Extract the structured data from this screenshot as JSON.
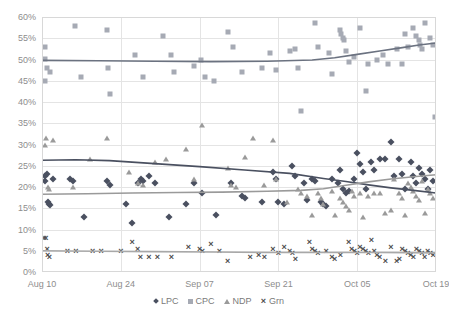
{
  "chart_data": {
    "type": "scatter",
    "title": "",
    "xlabel": "",
    "ylabel": "",
    "ylim": [
      0,
      60
    ],
    "ytick_labels": [
      "0%",
      "5%",
      "10%",
      "15%",
      "20%",
      "25%",
      "30%",
      "35%",
      "40%",
      "45%",
      "50%",
      "55%",
      "60%"
    ],
    "ytick_values": [
      0,
      5,
      10,
      15,
      20,
      25,
      30,
      35,
      40,
      45,
      50,
      55,
      60
    ],
    "xtick_labels": [
      "Aug 10",
      "Aug 24",
      "Sep 07",
      "Sep 21",
      "Oct 05",
      "Oct 19"
    ],
    "xtick_values": [
      0,
      14,
      28,
      42,
      56,
      70
    ],
    "xlim": [
      0,
      70
    ],
    "grid": true,
    "legend_position": "bottom",
    "legend": [
      "LPC",
      "CPC",
      "NDP",
      "Grn"
    ],
    "series": [
      {
        "name": "CPC",
        "marker": "square",
        "color": "#a6aab4",
        "trend_color": "#6b7280",
        "points": [
          [
            0.6,
            53.0
          ],
          [
            0.6,
            50.2
          ],
          [
            0.6,
            45.0
          ],
          [
            0.8,
            48.0
          ],
          [
            1.4,
            47.0
          ],
          [
            5.8,
            58.0
          ],
          [
            7.0,
            46.0
          ],
          [
            11.6,
            57.0
          ],
          [
            11.8,
            48.0
          ],
          [
            12.0,
            42.0
          ],
          [
            16.5,
            51.0
          ],
          [
            18.0,
            46.0
          ],
          [
            21.5,
            55.5
          ],
          [
            23.0,
            51.0
          ],
          [
            23.5,
            47.0
          ],
          [
            27.0,
            48.5
          ],
          [
            28.2,
            50.0
          ],
          [
            29.0,
            46.0
          ],
          [
            30.5,
            45.0
          ],
          [
            33.0,
            56.5
          ],
          [
            34.0,
            53.0
          ],
          [
            35.5,
            47.0
          ],
          [
            39.0,
            48.0
          ],
          [
            40.5,
            51.5
          ],
          [
            41.5,
            47.5
          ],
          [
            44.0,
            52.0
          ],
          [
            45.0,
            52.5
          ],
          [
            45.4,
            48.0
          ],
          [
            46.0,
            38.0
          ],
          [
            48.5,
            58.5
          ],
          [
            49.0,
            53.0
          ],
          [
            51.0,
            51.5
          ],
          [
            51.5,
            46.5
          ],
          [
            53.0,
            57.0
          ],
          [
            53.2,
            56.0
          ],
          [
            53.4,
            55.0
          ],
          [
            53.6,
            54.5
          ],
          [
            54.0,
            52.0
          ],
          [
            54.5,
            49.5
          ],
          [
            55.5,
            50.5
          ],
          [
            56.5,
            57.5
          ],
          [
            57.5,
            42.5
          ],
          [
            58.0,
            49.0
          ],
          [
            59.5,
            50.0
          ],
          [
            60.5,
            51.0
          ],
          [
            61.5,
            49.0
          ],
          [
            63.0,
            52.5
          ],
          [
            64.0,
            49.0
          ],
          [
            64.5,
            56.0
          ],
          [
            65.0,
            53.0
          ],
          [
            66.0,
            57.5
          ],
          [
            66.5,
            55.5
          ],
          [
            67.0,
            54.5
          ],
          [
            67.2,
            53.5
          ],
          [
            67.5,
            52.5
          ],
          [
            68.0,
            58.5
          ],
          [
            69.0,
            55.0
          ],
          [
            69.5,
            53.5
          ],
          [
            69.8,
            36.5
          ]
        ],
        "trend": [
          [
            0,
            49.8
          ],
          [
            10,
            49.7
          ],
          [
            20,
            49.6
          ],
          [
            30,
            49.5
          ],
          [
            40,
            49.6
          ],
          [
            48,
            49.9
          ],
          [
            52,
            50.4
          ],
          [
            56,
            51.2
          ],
          [
            60,
            52.0
          ],
          [
            64,
            52.8
          ],
          [
            67,
            53.4
          ],
          [
            70,
            53.9
          ]
        ]
      },
      {
        "name": "LPC",
        "marker": "diamond",
        "color": "#4a5060",
        "trend_color": "#4a5060",
        "points": [
          [
            0.5,
            22.5
          ],
          [
            0.6,
            21.5
          ],
          [
            0.8,
            23.0
          ],
          [
            1.0,
            16.5
          ],
          [
            1.2,
            16.0
          ],
          [
            1.5,
            15.8
          ],
          [
            2.0,
            22.0
          ],
          [
            5.0,
            22.0
          ],
          [
            5.5,
            21.5
          ],
          [
            7.5,
            13.0
          ],
          [
            11.5,
            21.5
          ],
          [
            12.0,
            20.5
          ],
          [
            15.0,
            16.0
          ],
          [
            16.0,
            11.5
          ],
          [
            17.0,
            21.0
          ],
          [
            17.5,
            22.0
          ],
          [
            18.0,
            21.5
          ],
          [
            19.0,
            22.5
          ],
          [
            20.0,
            21.0
          ],
          [
            22.5,
            13.0
          ],
          [
            25.5,
            16.0
          ],
          [
            27.0,
            21.0
          ],
          [
            28.5,
            18.5
          ],
          [
            31.0,
            13.5
          ],
          [
            33.5,
            21.0
          ],
          [
            35.5,
            18.0
          ],
          [
            36.0,
            17.5
          ],
          [
            39.0,
            16.5
          ],
          [
            41.0,
            23.5
          ],
          [
            41.5,
            22.0
          ],
          [
            42.0,
            16.5
          ],
          [
            43.0,
            16.0
          ],
          [
            44.5,
            25.0
          ],
          [
            45.0,
            22.5
          ],
          [
            46.5,
            21.0
          ],
          [
            47.0,
            17.0
          ],
          [
            48.0,
            22.0
          ],
          [
            48.5,
            21.5
          ],
          [
            49.5,
            16.5
          ],
          [
            50.0,
            16.0
          ],
          [
            50.5,
            15.5
          ],
          [
            51.5,
            22.0
          ],
          [
            52.5,
            21.0
          ],
          [
            53.0,
            24.0
          ],
          [
            53.5,
            19.5
          ],
          [
            54.0,
            18.5
          ],
          [
            54.5,
            19.0
          ],
          [
            55.5,
            22.0
          ],
          [
            56.0,
            28.0
          ],
          [
            56.5,
            25.5
          ],
          [
            57.0,
            23.5
          ],
          [
            57.5,
            19.5
          ],
          [
            58.5,
            26.0
          ],
          [
            59.0,
            24.0
          ],
          [
            60.0,
            26.5
          ],
          [
            61.0,
            26.5
          ],
          [
            62.0,
            30.5
          ],
          [
            62.5,
            22.5
          ],
          [
            63.5,
            26.5
          ],
          [
            64.0,
            23.0
          ],
          [
            64.5,
            19.5
          ],
          [
            65.5,
            26.0
          ],
          [
            66.0,
            22.5
          ],
          [
            66.5,
            21.0
          ],
          [
            67.0,
            24.5
          ],
          [
            67.5,
            23.0
          ],
          [
            68.0,
            22.0
          ],
          [
            68.5,
            19.5
          ],
          [
            69.0,
            24.0
          ],
          [
            69.5,
            21.5
          ]
        ],
        "trend": [
          [
            0,
            26.3
          ],
          [
            6,
            26.4
          ],
          [
            12,
            26.2
          ],
          [
            20,
            25.5
          ],
          [
            28,
            24.8
          ],
          [
            36,
            24.0
          ],
          [
            44,
            23.2
          ],
          [
            50,
            22.0
          ],
          [
            54,
            21.3
          ],
          [
            58,
            20.5
          ],
          [
            62,
            19.8
          ],
          [
            66,
            19.2
          ],
          [
            70,
            18.6
          ]
        ]
      },
      {
        "name": "NDP",
        "marker": "triangle",
        "color": "#9a9a9a",
        "trend_color": "#9a9a9a",
        "points": [
          [
            0.5,
            30.0
          ],
          [
            0.7,
            31.5
          ],
          [
            1.0,
            20.0
          ],
          [
            1.2,
            19.5
          ],
          [
            2.0,
            31.0
          ],
          [
            5.5,
            20.0
          ],
          [
            8.5,
            26.5
          ],
          [
            11.5,
            31.5
          ],
          [
            15.5,
            23.5
          ],
          [
            17.0,
            21.0
          ],
          [
            18.0,
            20.5
          ],
          [
            20.0,
            26.0
          ],
          [
            22.0,
            26.5
          ],
          [
            25.5,
            29.0
          ],
          [
            27.0,
            22.0
          ],
          [
            28.5,
            34.5
          ],
          [
            33.0,
            24.5
          ],
          [
            33.5,
            20.5
          ],
          [
            34.5,
            20.0
          ],
          [
            36.0,
            27.0
          ],
          [
            37.5,
            31.5
          ],
          [
            39.5,
            20.5
          ],
          [
            41.0,
            31.0
          ],
          [
            41.5,
            22.0
          ],
          [
            43.5,
            16.5
          ],
          [
            45.5,
            19.5
          ],
          [
            46.0,
            18.5
          ],
          [
            47.0,
            18.0
          ],
          [
            48.0,
            13.5
          ],
          [
            49.0,
            18.5
          ],
          [
            49.5,
            17.5
          ],
          [
            50.0,
            16.0
          ],
          [
            51.5,
            19.0
          ],
          [
            52.0,
            13.5
          ],
          [
            53.0,
            17.5
          ],
          [
            53.5,
            16.5
          ],
          [
            54.0,
            15.5
          ],
          [
            54.5,
            14.5
          ],
          [
            55.0,
            19.0
          ],
          [
            55.5,
            18.0
          ],
          [
            56.5,
            18.5
          ],
          [
            57.0,
            13.0
          ],
          [
            58.0,
            18.0
          ],
          [
            59.0,
            18.5
          ],
          [
            60.0,
            18.5
          ],
          [
            61.0,
            14.0
          ],
          [
            62.0,
            14.5
          ],
          [
            62.5,
            22.0
          ],
          [
            63.5,
            18.5
          ],
          [
            64.0,
            17.5
          ],
          [
            64.5,
            13.5
          ],
          [
            65.0,
            21.0
          ],
          [
            65.5,
            20.0
          ],
          [
            66.0,
            19.0
          ],
          [
            66.5,
            18.0
          ],
          [
            67.0,
            17.0
          ],
          [
            67.5,
            21.5
          ],
          [
            68.0,
            14.0
          ],
          [
            68.5,
            19.5
          ],
          [
            69.0,
            18.5
          ],
          [
            69.5,
            17.5
          ]
        ],
        "trend": [
          [
            0,
            18.3
          ],
          [
            8,
            18.4
          ],
          [
            16,
            18.6
          ],
          [
            24,
            18.7
          ],
          [
            32,
            18.8
          ],
          [
            40,
            19.0
          ],
          [
            46,
            19.2
          ],
          [
            50,
            19.6
          ],
          [
            54,
            20.4
          ],
          [
            58,
            21.2
          ],
          [
            62,
            21.9
          ],
          [
            66,
            22.4
          ],
          [
            70,
            22.9
          ]
        ]
      },
      {
        "name": "Grn",
        "marker": "x",
        "color": "#4d4d4d",
        "trend_color": "#a8a8a8",
        "points": [
          [
            0.4,
            8.0
          ],
          [
            0.7,
            8.0
          ],
          [
            0.9,
            5.5
          ],
          [
            1.0,
            4.0
          ],
          [
            1.3,
            3.5
          ],
          [
            4.5,
            5.0
          ],
          [
            6.0,
            5.0
          ],
          [
            9.0,
            5.0
          ],
          [
            10.5,
            5.0
          ],
          [
            14.0,
            5.0
          ],
          [
            16.0,
            7.0
          ],
          [
            17.0,
            5.5
          ],
          [
            17.5,
            3.5
          ],
          [
            19.0,
            3.5
          ],
          [
            20.5,
            3.5
          ],
          [
            23.0,
            3.5
          ],
          [
            26.0,
            6.0
          ],
          [
            28.0,
            5.5
          ],
          [
            28.5,
            5.0
          ],
          [
            30.0,
            6.5
          ],
          [
            31.5,
            5.0
          ],
          [
            33.0,
            2.5
          ],
          [
            37.0,
            3.5
          ],
          [
            38.5,
            4.0
          ],
          [
            39.5,
            3.5
          ],
          [
            41.0,
            5.5
          ],
          [
            42.0,
            4.5
          ],
          [
            43.0,
            6.0
          ],
          [
            44.0,
            5.0
          ],
          [
            44.5,
            4.5
          ],
          [
            45.0,
            3.0
          ],
          [
            47.5,
            7.0
          ],
          [
            48.0,
            5.5
          ],
          [
            48.5,
            5.0
          ],
          [
            49.0,
            4.5
          ],
          [
            50.5,
            5.0
          ],
          [
            51.5,
            3.5
          ],
          [
            52.0,
            3.0
          ],
          [
            53.0,
            4.0
          ],
          [
            54.5,
            7.0
          ],
          [
            55.0,
            5.5
          ],
          [
            55.5,
            5.0
          ],
          [
            56.0,
            4.5
          ],
          [
            56.5,
            6.0
          ],
          [
            57.0,
            5.5
          ],
          [
            57.5,
            5.0
          ],
          [
            58.0,
            4.5
          ],
          [
            58.5,
            7.5
          ],
          [
            59.0,
            5.0
          ],
          [
            59.5,
            4.0
          ],
          [
            60.0,
            3.5
          ],
          [
            61.0,
            2.5
          ],
          [
            62.0,
            6.0
          ],
          [
            63.0,
            2.5
          ],
          [
            63.5,
            3.0
          ],
          [
            64.0,
            5.5
          ],
          [
            64.5,
            5.0
          ],
          [
            65.0,
            4.5
          ],
          [
            65.5,
            4.0
          ],
          [
            66.0,
            3.5
          ],
          [
            66.5,
            5.5
          ],
          [
            67.0,
            5.0
          ],
          [
            67.5,
            4.5
          ],
          [
            68.0,
            3.5
          ],
          [
            68.5,
            5.0
          ],
          [
            69.0,
            4.5
          ],
          [
            69.5,
            4.0
          ]
        ],
        "trend": [
          [
            0,
            5.0
          ],
          [
            10,
            4.9
          ],
          [
            20,
            4.8
          ],
          [
            30,
            4.7
          ],
          [
            40,
            4.6
          ],
          [
            50,
            4.6
          ],
          [
            60,
            4.6
          ],
          [
            70,
            4.5
          ]
        ]
      }
    ]
  }
}
